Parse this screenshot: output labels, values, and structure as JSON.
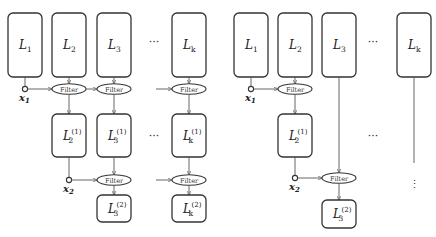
{
  "diagram": {
    "filter_label": "Filter",
    "left": {
      "row0": [
        {
          "name": "L",
          "sub": "1"
        },
        {
          "name": "L",
          "sub": "2"
        },
        {
          "name": "L",
          "sub": "3"
        },
        {
          "name": "L",
          "sub": "k"
        }
      ],
      "row1": [
        {
          "name": "L",
          "sub": "2",
          "sup": "(1)"
        },
        {
          "name": "L",
          "sub": "3",
          "sup": "(1)"
        },
        {
          "name": "L",
          "sub": "k",
          "sup": "(1)"
        }
      ],
      "row2": [
        {
          "name": "L",
          "sub": "3",
          "sup": "(2)"
        },
        {
          "name": "L",
          "sub": "k",
          "sup": "(2)"
        }
      ],
      "inputs": [
        {
          "name": "x",
          "sub": "1"
        },
        {
          "name": "x",
          "sub": "2"
        }
      ],
      "ellipsis": "···"
    },
    "right": {
      "row0": [
        {
          "name": "L",
          "sub": "1"
        },
        {
          "name": "L",
          "sub": "2"
        },
        {
          "name": "L",
          "sub": "3"
        },
        {
          "name": "L",
          "sub": "k"
        }
      ],
      "row1": [
        {
          "name": "L",
          "sub": "2",
          "sup": "(1)"
        }
      ],
      "row2": [
        {
          "name": "L",
          "sub": "3",
          "sup": "(2)"
        }
      ],
      "inputs": [
        {
          "name": "x",
          "sub": "1"
        },
        {
          "name": "x",
          "sub": "2"
        }
      ],
      "ellipsis": "···",
      "vertical_ellipsis": "⋮"
    }
  }
}
